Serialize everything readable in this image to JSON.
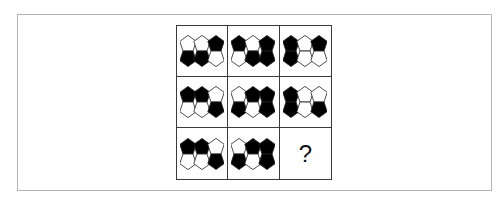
{
  "puzzle": {
    "type": "3x3 matrix reasoning",
    "colors": {
      "filled": "#000000",
      "empty": "#ffffff",
      "stroke": "#222222",
      "grid_line": "#3a3a3a",
      "frame": "#b4b4b4"
    },
    "cells": [
      {
        "row": 1,
        "col": 1,
        "top": [
          "W",
          "W",
          "B"
        ],
        "bottom": [
          "B",
          "B",
          "W"
        ]
      },
      {
        "row": 1,
        "col": 2,
        "top": [
          "B",
          "W",
          "B"
        ],
        "bottom": [
          "W",
          "B",
          "B"
        ]
      },
      {
        "row": 1,
        "col": 3,
        "top": [
          "B",
          "W",
          "B"
        ],
        "bottom": [
          "B",
          "W",
          "W"
        ]
      },
      {
        "row": 2,
        "col": 1,
        "top": [
          "B",
          "B",
          "W"
        ],
        "bottom": [
          "W",
          "W",
          "B"
        ]
      },
      {
        "row": 2,
        "col": 2,
        "top": [
          "W",
          "B",
          "B"
        ],
        "bottom": [
          "B",
          "W",
          "B"
        ]
      },
      {
        "row": 2,
        "col": 3,
        "top": [
          "B",
          "W",
          "W"
        ],
        "bottom": [
          "B",
          "W",
          "B"
        ]
      },
      {
        "row": 3,
        "col": 1,
        "top": [
          "B",
          "B",
          "W"
        ],
        "bottom": [
          "W",
          "W",
          "B"
        ]
      },
      {
        "row": 3,
        "col": 2,
        "top": [
          "W",
          "B",
          "B"
        ],
        "bottom": [
          "B",
          "W",
          "B"
        ]
      }
    ],
    "missing": {
      "row": 3,
      "col": 3,
      "label": "?"
    }
  }
}
